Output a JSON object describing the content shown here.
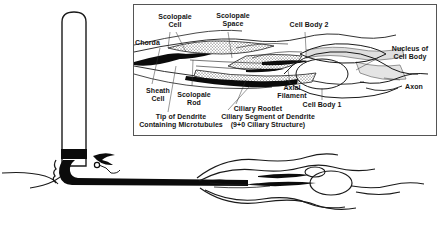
{
  "figure": {
    "type": "scientific-line-diagram",
    "background_color": "#ffffff",
    "ink_color": "#1a1a1a",
    "shade_color": "#d9d9d9",
    "panel": {
      "name": "magnified-detail-panel",
      "border_color": "#555555",
      "x": 133,
      "y": 4,
      "width": 304,
      "height": 132
    },
    "overview": {
      "name": "whole-sensillum-overview",
      "description": "Unlabeled low-magnification drawing of the bristle shaft, socket and sensory neuron below the detail panel"
    },
    "callout": {
      "name": "magnification-arrow",
      "description": "Black arrow at bristle base pointing to the magnified region"
    }
  },
  "labels": [
    {
      "id": "chorda",
      "text": "Chorda",
      "x": 137,
      "y": 40,
      "align": "left"
    },
    {
      "id": "scolopale-cell",
      "text": "Scolopale\nCell",
      "x": 155,
      "y": 14,
      "align": "center"
    },
    {
      "id": "scolopale-space",
      "text": "Scolopale\nSpace",
      "x": 212,
      "y": 13,
      "align": "center"
    },
    {
      "id": "cell-body-2",
      "text": "Cell Body 2",
      "x": 305,
      "y": 22,
      "align": "center"
    },
    {
      "id": "nucleus-of-cell-body",
      "text": "Nucleus of\nCell Body",
      "x": 385,
      "y": 47,
      "align": "center"
    },
    {
      "id": "axon",
      "text": "Axon",
      "x": 399,
      "y": 84,
      "align": "center"
    },
    {
      "id": "cell-body-1",
      "text": "Cell Body 1",
      "x": 318,
      "y": 104,
      "align": "center"
    },
    {
      "id": "axial-filament",
      "text": "Axial\nFilament",
      "x": 277,
      "y": 86,
      "align": "center"
    },
    {
      "id": "ciliary-rootlet",
      "text": "Ciliary Rootlet",
      "x": 250,
      "y": 108,
      "align": "center"
    },
    {
      "id": "sheath-cell",
      "text": "Sheath\nCell",
      "x": 140,
      "y": 88,
      "align": "center"
    },
    {
      "id": "scolopale-rod",
      "text": "Scolopale\nRod",
      "x": 177,
      "y": 93,
      "align": "center"
    },
    {
      "id": "tip-of-dendrite",
      "text": "Tip of Dendrite\nContaining Microtubules",
      "x": 135,
      "y": 115,
      "align": "left"
    },
    {
      "id": "ciliary-segment",
      "text": "Ciliary Segment of Dendrite\n(9+0 Ciliary Structure)",
      "x": 215,
      "y": 115,
      "align": "left"
    }
  ]
}
